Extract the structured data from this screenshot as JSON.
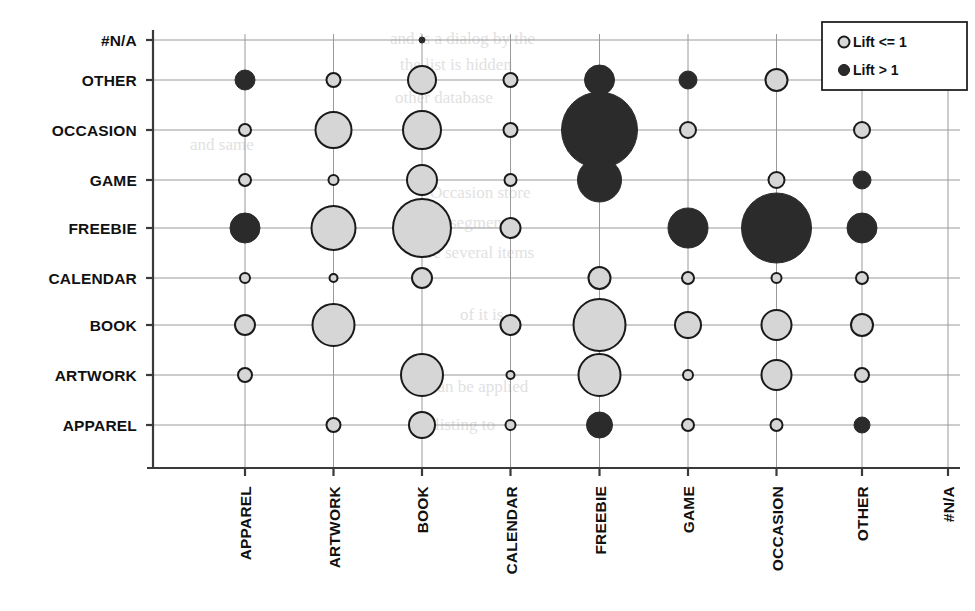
{
  "chart_data": {
    "type": "scatter",
    "title": "",
    "subtitle": "",
    "xlabel": "",
    "ylabel": "",
    "grid": true,
    "legend_position": "top-right",
    "bubble_note": "Bubble area encodes support/count; fill color encodes lift category",
    "categories_x": [
      "APPAREL",
      "ARTWORK",
      "BOOK",
      "CALENDAR",
      "FREEBIE",
      "GAME",
      "OCCASION",
      "OTHER",
      "#N/A"
    ],
    "categories_y": [
      "APPAREL",
      "ARTWORK",
      "BOOK",
      "CALENDAR",
      "FREEBIE",
      "GAME",
      "OCCASION",
      "OTHER",
      "#N/A"
    ],
    "legend": [
      {
        "label": "Lift <= 1",
        "marker": "open-circle",
        "fill": "#d8d8d8",
        "stroke": "#1a1a1a"
      },
      {
        "label": "Lift > 1",
        "marker": "filled-circle",
        "fill": "#2b2b2b",
        "stroke": "#1a1a1a"
      }
    ],
    "colors": {
      "lift_low_fill": "#d6d6d6",
      "lift_high_fill": "#2b2b2b",
      "marker_stroke": "#1a1a1a",
      "grid": "#9a9a9a",
      "axis": "#3a3a3a",
      "background": "#ffffff"
    },
    "points": [
      {
        "x": "APPAREL",
        "y": "OTHER",
        "r": 10,
        "lift": "high"
      },
      {
        "x": "APPAREL",
        "y": "OCCASION",
        "r": 6,
        "lift": "low"
      },
      {
        "x": "APPAREL",
        "y": "GAME",
        "r": 6,
        "lift": "low"
      },
      {
        "x": "APPAREL",
        "y": "FREEBIE",
        "r": 15,
        "lift": "high"
      },
      {
        "x": "APPAREL",
        "y": "CALENDAR",
        "r": 5,
        "lift": "low"
      },
      {
        "x": "APPAREL",
        "y": "BOOK",
        "r": 10,
        "lift": "low"
      },
      {
        "x": "APPAREL",
        "y": "ARTWORK",
        "r": 7,
        "lift": "low"
      },
      {
        "x": "ARTWORK",
        "y": "OTHER",
        "r": 7,
        "lift": "low"
      },
      {
        "x": "ARTWORK",
        "y": "OCCASION",
        "r": 18,
        "lift": "low"
      },
      {
        "x": "ARTWORK",
        "y": "GAME",
        "r": 5,
        "lift": "low"
      },
      {
        "x": "ARTWORK",
        "y": "FREEBIE",
        "r": 22,
        "lift": "low"
      },
      {
        "x": "ARTWORK",
        "y": "CALENDAR",
        "r": 4,
        "lift": "low"
      },
      {
        "x": "ARTWORK",
        "y": "BOOK",
        "r": 21,
        "lift": "low"
      },
      {
        "x": "ARTWORK",
        "y": "APPAREL",
        "r": 7,
        "lift": "low"
      },
      {
        "x": "BOOK",
        "y": "#N/A",
        "r": 3,
        "lift": "high"
      },
      {
        "x": "BOOK",
        "y": "OTHER",
        "r": 14,
        "lift": "low"
      },
      {
        "x": "BOOK",
        "y": "OCCASION",
        "r": 19,
        "lift": "low"
      },
      {
        "x": "BOOK",
        "y": "GAME",
        "r": 15,
        "lift": "low"
      },
      {
        "x": "BOOK",
        "y": "FREEBIE",
        "r": 29,
        "lift": "low"
      },
      {
        "x": "BOOK",
        "y": "CALENDAR",
        "r": 10,
        "lift": "low"
      },
      {
        "x": "BOOK",
        "y": "ARTWORK",
        "r": 21,
        "lift": "low"
      },
      {
        "x": "BOOK",
        "y": "APPAREL",
        "r": 13,
        "lift": "low"
      },
      {
        "x": "CALENDAR",
        "y": "OTHER",
        "r": 7,
        "lift": "low"
      },
      {
        "x": "CALENDAR",
        "y": "OCCASION",
        "r": 7,
        "lift": "low"
      },
      {
        "x": "CALENDAR",
        "y": "GAME",
        "r": 6,
        "lift": "low"
      },
      {
        "x": "CALENDAR",
        "y": "FREEBIE",
        "r": 10,
        "lift": "low"
      },
      {
        "x": "CALENDAR",
        "y": "BOOK",
        "r": 10,
        "lift": "low"
      },
      {
        "x": "CALENDAR",
        "y": "ARTWORK",
        "r": 4,
        "lift": "low"
      },
      {
        "x": "CALENDAR",
        "y": "APPAREL",
        "r": 5,
        "lift": "low"
      },
      {
        "x": "FREEBIE",
        "y": "OTHER",
        "r": 15,
        "lift": "high"
      },
      {
        "x": "FREEBIE",
        "y": "OCCASION",
        "r": 38,
        "lift": "high"
      },
      {
        "x": "FREEBIE",
        "y": "GAME",
        "r": 22,
        "lift": "high"
      },
      {
        "x": "FREEBIE",
        "y": "CALENDAR",
        "r": 11,
        "lift": "low"
      },
      {
        "x": "FREEBIE",
        "y": "BOOK",
        "r": 26,
        "lift": "low"
      },
      {
        "x": "FREEBIE",
        "y": "ARTWORK",
        "r": 21,
        "lift": "low"
      },
      {
        "x": "FREEBIE",
        "y": "APPAREL",
        "r": 13,
        "lift": "high"
      },
      {
        "x": "GAME",
        "y": "OTHER",
        "r": 9,
        "lift": "high"
      },
      {
        "x": "GAME",
        "y": "OCCASION",
        "r": 8,
        "lift": "low"
      },
      {
        "x": "GAME",
        "y": "FREEBIE",
        "r": 20,
        "lift": "high"
      },
      {
        "x": "GAME",
        "y": "CALENDAR",
        "r": 6,
        "lift": "low"
      },
      {
        "x": "GAME",
        "y": "BOOK",
        "r": 13,
        "lift": "low"
      },
      {
        "x": "GAME",
        "y": "ARTWORK",
        "r": 5,
        "lift": "low"
      },
      {
        "x": "GAME",
        "y": "APPAREL",
        "r": 6,
        "lift": "low"
      },
      {
        "x": "OCCASION",
        "y": "OTHER",
        "r": 11,
        "lift": "low"
      },
      {
        "x": "OCCASION",
        "y": "GAME",
        "r": 8,
        "lift": "low"
      },
      {
        "x": "OCCASION",
        "y": "FREEBIE",
        "r": 35,
        "lift": "high"
      },
      {
        "x": "OCCASION",
        "y": "CALENDAR",
        "r": 5,
        "lift": "low"
      },
      {
        "x": "OCCASION",
        "y": "BOOK",
        "r": 15,
        "lift": "low"
      },
      {
        "x": "OCCASION",
        "y": "ARTWORK",
        "r": 15,
        "lift": "low"
      },
      {
        "x": "OCCASION",
        "y": "APPAREL",
        "r": 6,
        "lift": "low"
      },
      {
        "x": "OTHER",
        "y": "OCCASION",
        "r": 8,
        "lift": "low"
      },
      {
        "x": "OTHER",
        "y": "GAME",
        "r": 9,
        "lift": "high"
      },
      {
        "x": "OTHER",
        "y": "FREEBIE",
        "r": 15,
        "lift": "high"
      },
      {
        "x": "OTHER",
        "y": "CALENDAR",
        "r": 6,
        "lift": "low"
      },
      {
        "x": "OTHER",
        "y": "BOOK",
        "r": 11,
        "lift": "low"
      },
      {
        "x": "OTHER",
        "y": "ARTWORK",
        "r": 7,
        "lift": "low"
      },
      {
        "x": "OTHER",
        "y": "APPAREL",
        "r": 8,
        "lift": "high"
      }
    ]
  }
}
